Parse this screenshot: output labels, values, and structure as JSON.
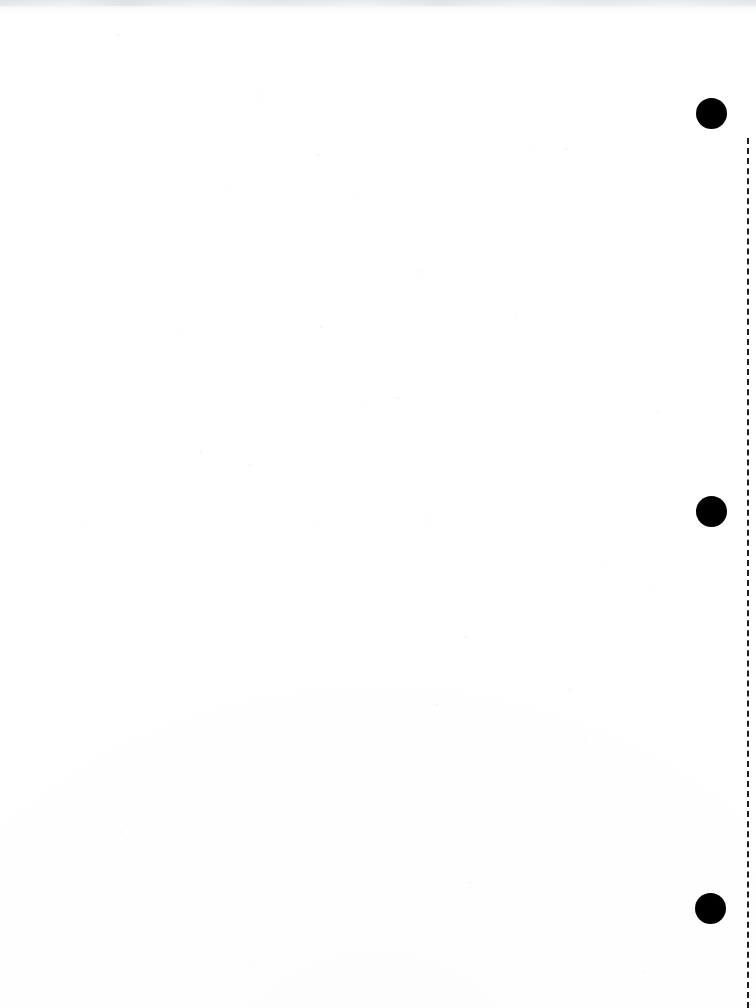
{
  "page": {
    "label": "Scanned blank page",
    "width_px": 756,
    "height_px": 1008,
    "background_color": "#ffffff",
    "content_text": "",
    "note": ""
  },
  "artifacts": {
    "scan_edge_top": {
      "name": "top-scan-edge-shadow",
      "color": "#e4e5e7",
      "height_px": 16
    },
    "speckle_layer": {
      "name": "scan-dust-speckles",
      "color": "#aaacb0"
    }
  },
  "punch_holes": [
    {
      "name": "punch-hole-top",
      "x": 711,
      "y": 113,
      "diameter": 31,
      "color": "#000000"
    },
    {
      "name": "punch-hole-middle",
      "x": 711,
      "y": 511,
      "diameter": 31,
      "color": "#000000"
    },
    {
      "name": "punch-hole-bottom",
      "x": 710,
      "y": 908,
      "diameter": 31,
      "color": "#000000"
    }
  ],
  "binding_guide": {
    "name": "dashed-binding-guide",
    "x": 748,
    "y_start": 138,
    "y_end": 1008,
    "color": "#1c1c1c",
    "stroke_width": 2,
    "style": "dashed"
  }
}
